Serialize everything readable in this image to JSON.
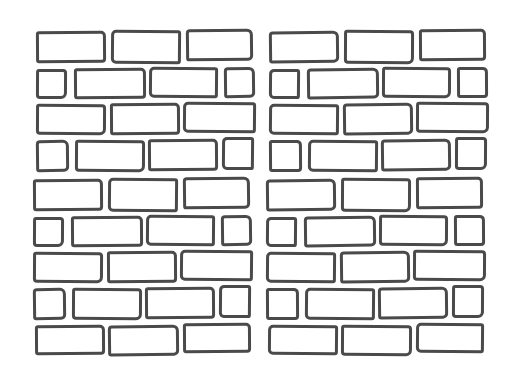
{
  "image": {
    "description": "Hand-drawn brick wall pattern, 2x2 repeated tile",
    "stroke_color": "#4a4a4a",
    "background_color": "#ffffff"
  },
  "tile_offsets": [
    {
      "name": "top-left",
      "x": 0,
      "y": 0
    },
    {
      "name": "top-right",
      "x": 233,
      "y": 0
    },
    {
      "name": "bottom-left",
      "x": -3,
      "y": 148
    },
    {
      "name": "bottom-right",
      "x": 230,
      "y": 148
    }
  ],
  "top_rows": [
    [
      {
        "x": 36,
        "y": 31,
        "w": 70,
        "h": 32
      },
      {
        "x": 111,
        "y": 30,
        "w": 70,
        "h": 34
      },
      {
        "x": 186,
        "y": 29,
        "w": 67,
        "h": 32
      }
    ],
    [
      {
        "x": 36,
        "y": 69,
        "w": 31,
        "h": 30
      },
      {
        "x": 74,
        "y": 68,
        "w": 72,
        "h": 31
      },
      {
        "x": 149,
        "y": 67,
        "w": 69,
        "h": 31
      },
      {
        "x": 224,
        "y": 67,
        "w": 31,
        "h": 31
      }
    ],
    [
      {
        "x": 36,
        "y": 104,
        "w": 70,
        "h": 31
      },
      {
        "x": 110,
        "y": 103,
        "w": 70,
        "h": 32
      },
      {
        "x": 183,
        "y": 102,
        "w": 73,
        "h": 31
      }
    ],
    [
      {
        "x": 36,
        "y": 140,
        "w": 33,
        "h": 32
      },
      {
        "x": 75,
        "y": 140,
        "w": 70,
        "h": 32
      },
      {
        "x": 148,
        "y": 139,
        "w": 70,
        "h": 32
      },
      {
        "x": 222,
        "y": 137,
        "w": 32,
        "h": 33
      }
    ]
  ],
  "bottom_extra_row": [
    {
      "x": 35,
      "y": 325,
      "w": 70,
      "h": 30
    },
    {
      "x": 108,
      "y": 325,
      "w": 71,
      "h": 31
    },
    {
      "x": 183,
      "y": 323,
      "w": 68,
      "h": 30
    }
  ]
}
